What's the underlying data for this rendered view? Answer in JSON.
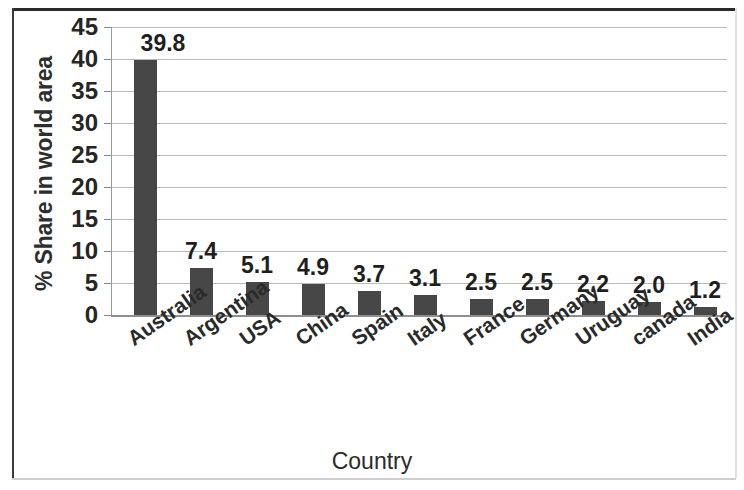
{
  "chart_data": {
    "type": "bar",
    "title": "",
    "xlabel": "Country",
    "ylabel": "% Share in world area",
    "categories": [
      "Australia",
      "Argentina",
      "USA",
      "China",
      "Spain",
      "Italy",
      "France",
      "Germany",
      "Uruguay",
      "canada",
      "India"
    ],
    "values": [
      39.8,
      7.4,
      5.1,
      4.9,
      3.7,
      3.1,
      2.5,
      2.5,
      2.2,
      2.0,
      1.2
    ],
    "value_labels": [
      "39.8",
      "7.4",
      "5.1",
      "4.9",
      "3.7",
      "3.1",
      "2.5",
      "2.5",
      "2.2",
      "2.0",
      "1.2"
    ],
    "ylim": [
      0,
      45
    ],
    "yticks": [
      0,
      5,
      10,
      15,
      20,
      25,
      30,
      35,
      40,
      45
    ],
    "ytick_labels": [
      "0",
      "5",
      "10",
      "15",
      "20",
      "25",
      "30",
      "35",
      "40",
      "45"
    ],
    "grid": true,
    "legend": false,
    "legend_position": "none",
    "bar_color": "#474747",
    "gridline_color": "#b9b9b9",
    "axis_color": "#8f8f8f",
    "data_label_color": "#1f1f1f",
    "show_data_labels": true
  }
}
